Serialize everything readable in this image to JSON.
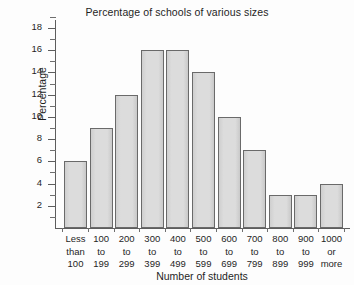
{
  "chart_data": {
    "type": "bar",
    "title": "Percentage of schools of various sizes",
    "xlabel": "Number of students",
    "ylabel": "Percentage",
    "categories": [
      "Less than 100",
      "100 to 199",
      "200 to 299",
      "300 to 399",
      "400 to 499",
      "500 to 599",
      "600 to 699",
      "700 to 799",
      "800 to 899",
      "900 to 999",
      "1000 or more"
    ],
    "category_lines": [
      [
        "Less",
        "than",
        "100"
      ],
      [
        "100",
        "to",
        "199"
      ],
      [
        "200",
        "to",
        "299"
      ],
      [
        "300",
        "to",
        "399"
      ],
      [
        "400",
        "to",
        "499"
      ],
      [
        "500",
        "to",
        "599"
      ],
      [
        "600",
        "to",
        "699"
      ],
      [
        "700",
        "to",
        "799"
      ],
      [
        "800",
        "to",
        "899"
      ],
      [
        "900",
        "to",
        "999"
      ],
      [
        "1000",
        "or",
        "more"
      ]
    ],
    "values": [
      6,
      9,
      12,
      16,
      16,
      14,
      10,
      7,
      3,
      3,
      4
    ],
    "ylim": [
      0,
      19
    ],
    "ytick_major": [
      2,
      4,
      6,
      8,
      10,
      12,
      14,
      16,
      18
    ],
    "ytick_major_labels": [
      "2",
      "4",
      "6",
      "8",
      "10",
      "12",
      "14",
      "16",
      "18"
    ],
    "ytick_minor": [
      1,
      3,
      5,
      7,
      9,
      11,
      13,
      15,
      17,
      19
    ],
    "grid": false,
    "legend": false,
    "bar_fill_color": "#d9d9d9",
    "bar_border_color": "#6a6a6a",
    "axis_color": "#5d5d5d",
    "background_color": "#fdfdfd",
    "text_color": "#1f1f1f"
  }
}
